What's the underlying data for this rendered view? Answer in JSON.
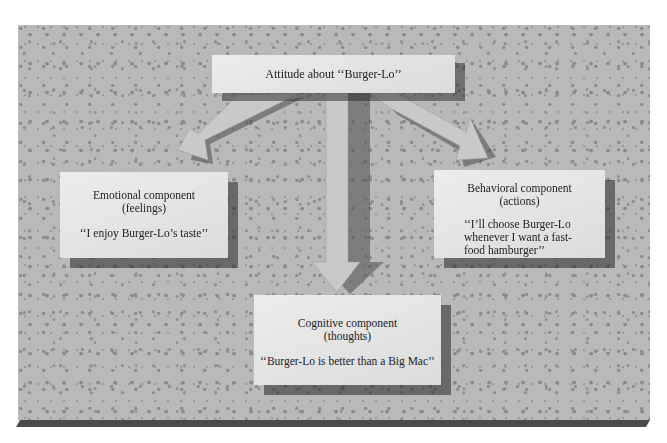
{
  "diagram": {
    "top": {
      "label": "Attitude about ‘‘Burger-Lo’’"
    },
    "emotional": {
      "title": "Emotional component",
      "subtitle": "(feelings)",
      "quote": "‘‘I enjoy Burger-Lo’s taste’’"
    },
    "behavioral": {
      "title": "Behavioral component",
      "subtitle": "(actions)",
      "quote_line1": "‘‘I’ll choose Burger-Lo",
      "quote_line2": "whenever I want a fast-",
      "quote_line3": "food hamburger’’"
    },
    "cognitive": {
      "title": "Cognitive component",
      "subtitle": "(thoughts)",
      "quote": "‘‘Burger-Lo is better than a Big Mac’’"
    },
    "colors": {
      "board": "#b9b9b9",
      "card": "#e4e4e4",
      "shadow": "#3a3a3a",
      "edge": "#4a4a4a"
    }
  }
}
